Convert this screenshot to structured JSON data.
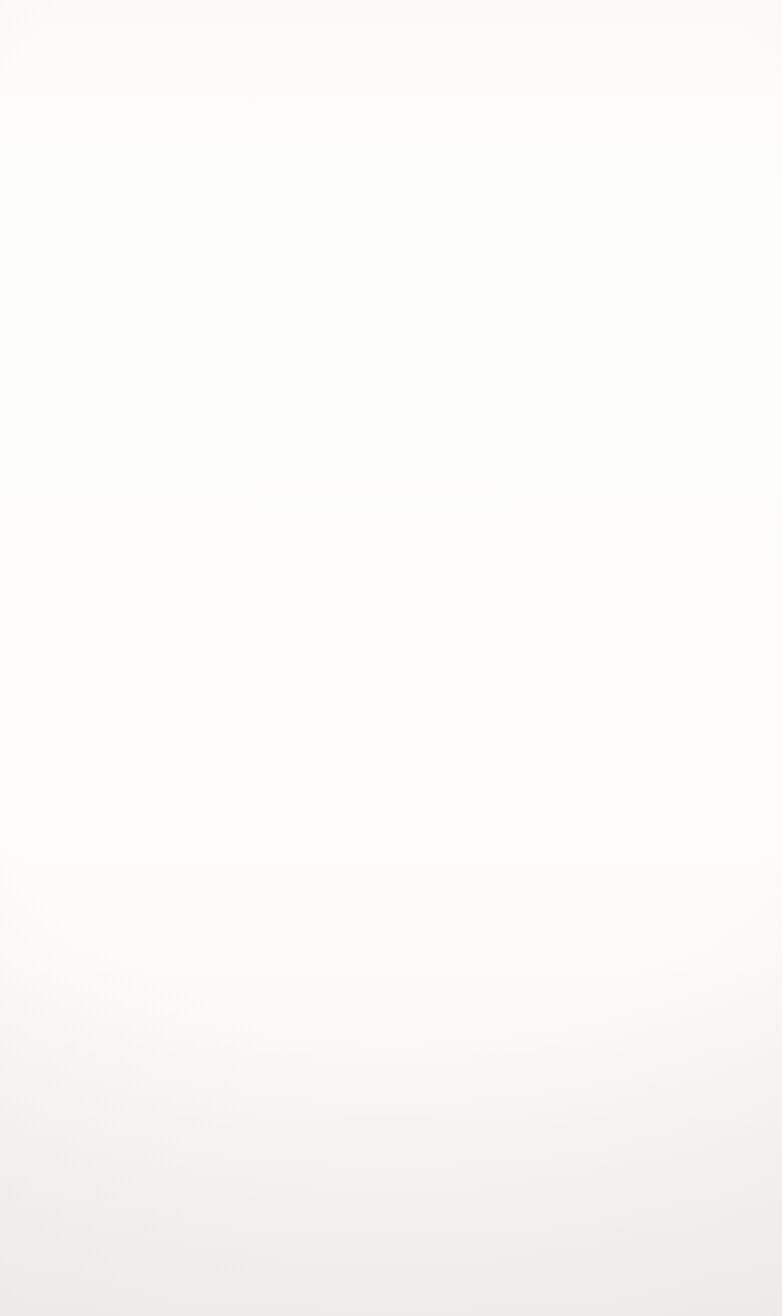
{
  "figure": {
    "kind": "textbook-illustration",
    "palette": {
      "ink": "#231f20",
      "leader_line": "#1b1b1b",
      "petal_light": "#a3a3a3",
      "petal_dark": "#6e6e6e",
      "anther_dark": "#4a4a4a",
      "ovary_wall": "#8f8f8f",
      "integument": "#6b6b6b",
      "embryo_sac": "#d8d8d8",
      "arrow_dark": "#5b5b5b",
      "arrow_light": "#cfcfcf",
      "seed_coat": "#8d8d8d",
      "endosperm": "#d9d9d9",
      "embryo_tissue": "#c2c2c2",
      "paper": "#fdfdfc",
      "bleed_text": "#c9c6c1"
    }
  },
  "labels": {
    "ovule": "Ovule",
    "endosperm_nucleus": "Endosperm\nnucleus",
    "zygote_top": "Zygote",
    "integuments": "Integuments",
    "zygote_stage": "Zygote",
    "terminal_cell": "Terminal cell",
    "basal_cell_upper": "Basal cell",
    "proembryo": "Proembryo",
    "suspensor_mid": "Suspensor",
    "basal_cell_lower": "Basal cell",
    "cotyledons": "Cotyledons",
    "shoot_apex": "Shoot\napex",
    "root_apex": "Root\napex",
    "seed_coat": "Seed coat",
    "suspensor_seed": "Suspensor",
    "endosperm_seed": "Endosperm"
  },
  "stages": [
    {
      "name": "flower-ovary-cross-section",
      "caption": "Ovule within ovary showing endosperm nucleus, zygote and integuments"
    },
    {
      "name": "zygote",
      "caption": "Single-celled zygote"
    },
    {
      "name": "two-cell-stage",
      "caption": "Terminal cell and basal cell"
    },
    {
      "name": "early-proembryo",
      "caption": "Multicellular early proembryo"
    },
    {
      "name": "proembryo-with-suspensor",
      "caption": "Proembryo atop suspensor and basal cell"
    },
    {
      "name": "heart-stage-embryo",
      "caption": "Heart-stage embryo on suspensor"
    },
    {
      "name": "torpedo-stage-embryo",
      "caption": "Torpedo-stage embryo on suspensor"
    },
    {
      "name": "mature-seed",
      "caption": "Mature seed with cotyledons, shoot apex, root apex, seed coat and endosperm"
    }
  ],
  "bleed_text": {
    "note": "Faint mirror-reversed show-through text from the reverse side of the printed page",
    "heading": "Structure of the Mature Seed",
    "lines": [
      "during the last stages of maturation",
      "much of its water content is lost. The",
      "embryo, which is surrounded by",
      "endosperm, has become dormant",
      "and remains so until the seed is",
      "planted. The tough seed coat formed",
      "from the integuments protects the dormant",
      "embryo until the seed is planted and grows.",
      "is sometimes called the embryo sac. The",
      "ovule then develops into the seed. The",
      "Figure 16. In fact, the whole seed is",
      "Nutritive tissue inside the seed is called",
      "the endosperm. The hypocotyl terminates",
      "at its lower end in the radicle, which will",
      "become the first root of the seedling.",
      "the embryo grows",
      "that the seedling can",
      "emerges first when the seed germinates",
      "the root system of a young plant",
      "seed begins to develop a shoot system",
      "one cotyledon, whereas dicots have two",
      "cotyledons are folded within the seed",
      "absorb nutrients from the endosperm"
    ]
  }
}
